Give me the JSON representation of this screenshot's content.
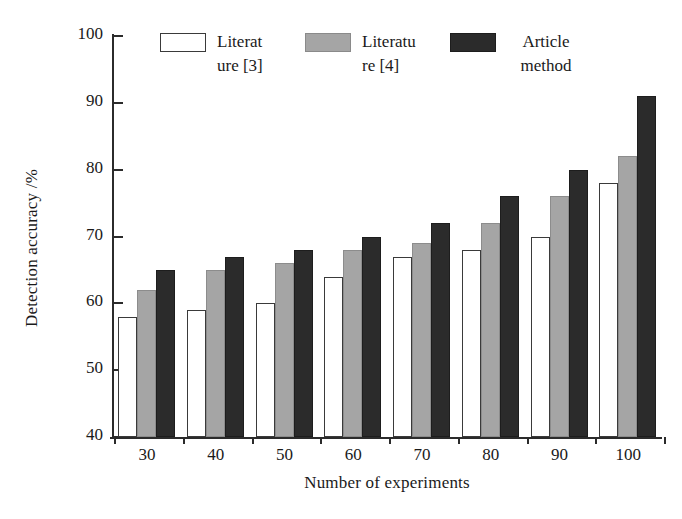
{
  "chart_data": {
    "type": "bar",
    "title": "",
    "xlabel": "Number of experiments",
    "ylabel": "Detection accuracy /%",
    "categories": [
      "30",
      "40",
      "50",
      "60",
      "70",
      "80",
      "90",
      "100"
    ],
    "ylim": [
      40,
      100
    ],
    "yticks": [
      "40",
      "50",
      "60",
      "70",
      "80",
      "90",
      "100"
    ],
    "grid": false,
    "legend_position": "top-center",
    "series": [
      {
        "name": "Literature [3]",
        "label_lines": "Literat\nure [3]",
        "color": "#ffffff",
        "edge_color": "#3a3a3a",
        "values": [
          58,
          59,
          60,
          64,
          67,
          68,
          70,
          78
        ]
      },
      {
        "name": "Literature [4]",
        "label_lines": "Literatu\nre [4]",
        "color": "#a5a5a5",
        "edge_color": "#8a8a8a",
        "values": [
          62,
          65,
          66,
          68,
          69,
          72,
          76,
          82
        ]
      },
      {
        "name": "Article method",
        "label_lines": "Article\nmethod",
        "color": "#2b2b2b",
        "edge_color": "#1d1d1d",
        "values": [
          65,
          67,
          68,
          70,
          72,
          76,
          80,
          91
        ]
      }
    ]
  }
}
